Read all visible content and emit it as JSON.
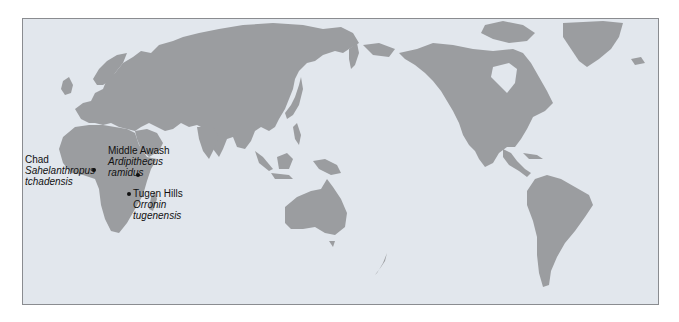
{
  "map": {
    "projection": "pacific-centered world map",
    "colors": {
      "ocean": "#e2e7ed",
      "land": "#9b9da0",
      "border": "#8a8c90",
      "text": "#111111"
    }
  },
  "sites": [
    {
      "place": "Chad",
      "species_line1": "Sahelanthropus",
      "species_line2": "tchadensis"
    },
    {
      "place": "Middle Awash",
      "species_line1": "Ardipithecus",
      "species_line2": "ramidus"
    },
    {
      "place": "Tugen Hills",
      "species_line1": "Orronin",
      "species_line2": "tugenensis"
    }
  ]
}
